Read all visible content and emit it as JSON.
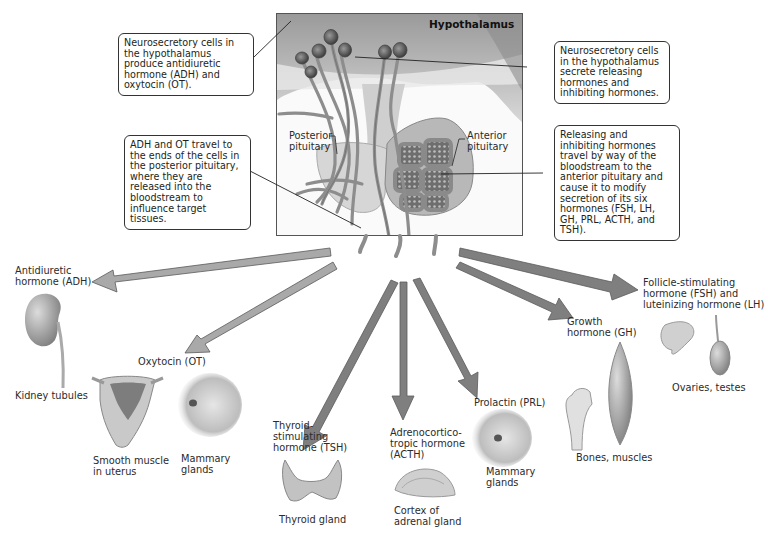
{
  "header": {
    "hypothalamus_label": "Hypothalamus",
    "posterior_label": "Posterior\npituitary",
    "anterior_label": "Anterior\npituitary"
  },
  "callouts": {
    "top_left": "Neurosecretory cells in the hypothalamus produce antidiuretic hormone (ADH) and oxytocin (OT).",
    "mid_left": "ADH and OT travel to the ends of the cells in the posterior pituitary, where they are released into the bloodstream to influence target tissues.",
    "top_right": "Neurosecretory cells in the hypothalamus secrete releasing hormones and inhibiting hormones.",
    "mid_right": "Releasing and inhibiting hormones travel by way of the bloodstream to the anterior pituitary and cause it to modify secretion of its six hormones (FSH, LH, GH, PRL, ACTH, and TSH)."
  },
  "hormones": [
    {
      "id": "adh",
      "name": "Antidiuretic\nhormone (ADH)",
      "target": "Kidney tubules",
      "source": "posterior"
    },
    {
      "id": "ot",
      "name": "Oxytocin (OT)",
      "target": [
        "Smooth muscle\nin uterus",
        "Mammary\nglands"
      ],
      "source": "posterior"
    },
    {
      "id": "tsh",
      "name": "Thyroid-\nstimulating\nhormone (TSH)",
      "target": "Thyroid gland",
      "source": "anterior"
    },
    {
      "id": "acth",
      "name": "Adrenocortico-\ntropic hormone\n(ACTH)",
      "target": "Cortex of\nadrenal gland",
      "source": "anterior"
    },
    {
      "id": "prl",
      "name": "Prolactin (PRL)",
      "target": "Mammary\nglands",
      "source": "anterior"
    },
    {
      "id": "gh",
      "name": "Growth\nhormone (GH)",
      "target": "Bones, muscles",
      "source": "anterior"
    },
    {
      "id": "fsh_lh",
      "name": "Follicle-stimulating\nhormone (FSH) and\nluteinizing hormone (LH)",
      "target": "Ovaries, testes",
      "source": "anterior"
    }
  ],
  "labels": {
    "adh": "Antidiuretic\nhormone (ADH)",
    "kidney": "Kidney tubules",
    "ot": "Oxytocin (OT)",
    "uterus": "Smooth muscle\nin uterus",
    "mammary_ot": "Mammary\nglands",
    "tsh": "Thyroid-\nstimulating\nhormone (TSH)",
    "thyroid": "Thyroid gland",
    "acth": "Adrenocortico-\ntropic hormone\n(ACTH)",
    "adrenal": "Cortex of\nadrenal gland",
    "prl": "Prolactin (PRL)",
    "mammary_prl": "Mammary\nglands",
    "gh": "Growth\nhormone (GH)",
    "bones": "Bones, muscles",
    "fsh": "Follicle-stimulating\nhormone (FSH) and\nluteinizing hormone (LH)",
    "ovaries": "Ovaries, testes"
  },
  "colors": {
    "posterior_arrow": "#a9a9a9",
    "anterior_arrow": "#7f7f7f",
    "arrow_outline": "#5a5a5a",
    "callout_border": "#333333",
    "tissue": "#d8d8d8",
    "vessel": "#8a8a8a"
  }
}
